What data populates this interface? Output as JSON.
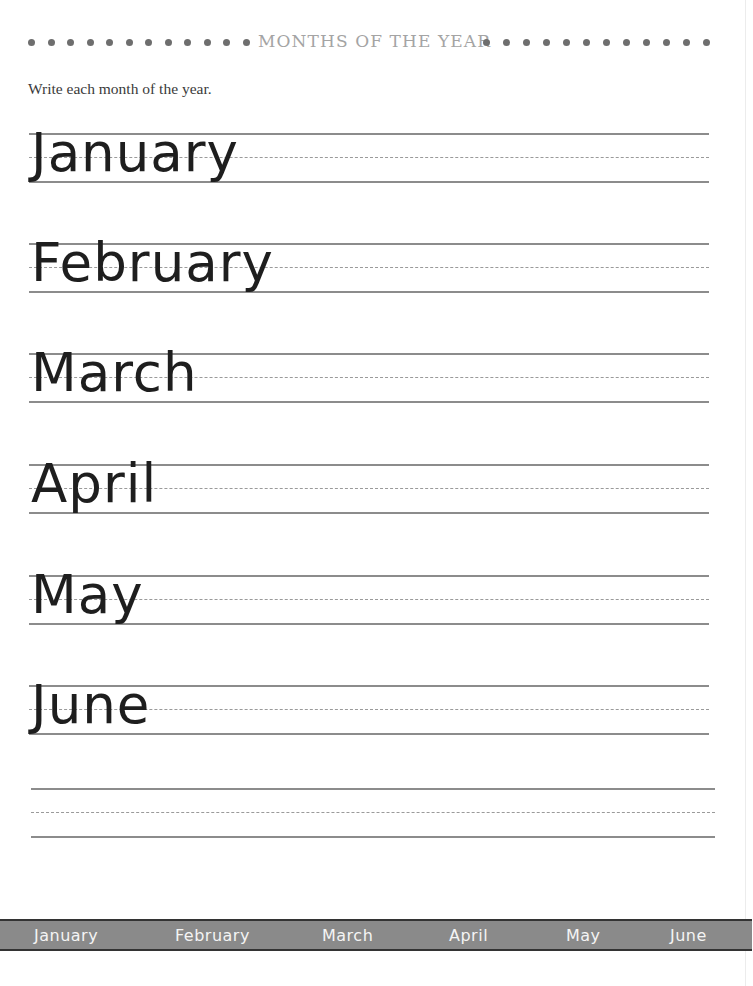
{
  "header": {
    "title": "MONTHS OF THE YEAR",
    "left_dot_count": 12,
    "right_dot_count": 12
  },
  "instruction": "Write each month of the year.",
  "practice_rows": [
    {
      "word": "January"
    },
    {
      "word": "February"
    },
    {
      "word": "March"
    },
    {
      "word": "April"
    },
    {
      "word": "May"
    },
    {
      "word": "June"
    },
    {
      "word": ""
    }
  ],
  "bottom_strip": {
    "items": [
      "January",
      "February",
      "March",
      "April",
      "May",
      "June"
    ]
  },
  "colors": {
    "strip_background": "#8a8a8a",
    "strip_text": "#f4f4f4",
    "line": "#8c8c8c",
    "header_title": "#a4a4a4",
    "dot": "#6e6e6e"
  }
}
